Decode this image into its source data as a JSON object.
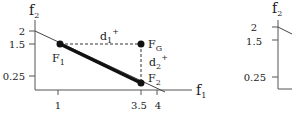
{
  "panels": [
    {
      "id": "left",
      "axes": {
        "x_label": "f",
        "x_label_sub": "1",
        "y_label": "f",
        "y_label_sub": "2",
        "x_ticks": [
          "1",
          "3.5",
          "4"
        ],
        "y_ticks": [
          "2",
          "1.5",
          "0.25"
        ]
      },
      "points": [
        {
          "name": "F",
          "sub": "1",
          "x": 1,
          "y": 1.5
        },
        {
          "name": "F",
          "sub": "G",
          "x": 3.5,
          "y": 1.5
        },
        {
          "name": "F",
          "sub": "2",
          "x": 3.5,
          "y": 0.25
        }
      ],
      "distances": [
        {
          "name": "d",
          "sub": "1",
          "sup": "+",
          "from": "F1",
          "to": "FG"
        },
        {
          "name": "d",
          "sub": "2",
          "sup": "+",
          "from": "FG",
          "to": "F2"
        }
      ],
      "lines": [
        {
          "type": "thin",
          "from": [
            0,
            2
          ],
          "to": [
            4,
            0
          ]
        },
        {
          "type": "thick",
          "from": [
            1,
            1.5
          ],
          "to": [
            3.5,
            0.25
          ]
        }
      ]
    },
    {
      "id": "right",
      "axes": {
        "y_label": "f",
        "y_label_sub": "2",
        "y_ticks": [
          "2",
          "1.5",
          "0.25"
        ]
      }
    }
  ],
  "colors": {
    "ink": "#222222",
    "axis": "#555555",
    "background": "#ffffff"
  }
}
